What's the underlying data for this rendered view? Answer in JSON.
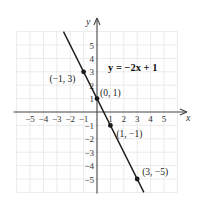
{
  "chart_data": {
    "type": "line",
    "title": "",
    "equation_label": "y = −2x + 1",
    "xlabel": "x",
    "ylabel": "y",
    "xlim": [
      -6,
      6
    ],
    "ylim": [
      -6,
      6
    ],
    "grid": true,
    "x_ticks": [
      -5,
      -4,
      -3,
      -2,
      -1,
      1,
      2,
      3,
      4,
      5
    ],
    "y_ticks": [
      5,
      4,
      3,
      2,
      1,
      -1,
      -2,
      -3,
      -4,
      -5
    ],
    "x_tick_labels": [
      "−5",
      "−4",
      "−3",
      "−2",
      "−1",
      "1",
      "2",
      "3",
      "4",
      "5"
    ],
    "y_tick_labels": [
      "5",
      "4",
      "3",
      "2",
      "1",
      "−1",
      "−2",
      "−3",
      "−4",
      "−5"
    ],
    "series": [
      {
        "name": "y = −2x + 1",
        "slope": -2,
        "intercept": 1,
        "line_extent": {
          "x": [
            -2.5,
            3.5
          ],
          "y": [
            6,
            -6
          ]
        },
        "points": [
          {
            "x": -1,
            "y": 3,
            "label": "(−1, 3)"
          },
          {
            "x": 0,
            "y": 1,
            "label": "(0, 1)"
          },
          {
            "x": 1,
            "y": -1,
            "label": "(1, −1)"
          },
          {
            "x": 3,
            "y": -5,
            "label": "(3, −5)"
          }
        ]
      }
    ]
  },
  "colors": {
    "line": "#1a1a1a",
    "axis": "#444444",
    "grid": "#e6e6e6",
    "background": "#ffffff"
  }
}
